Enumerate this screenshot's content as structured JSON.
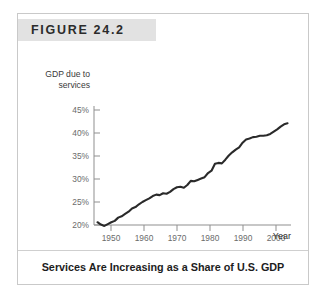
{
  "figure": {
    "label": "FIGURE 24.2",
    "caption": "Services Are Increasing as a Share of U.S. GDP"
  },
  "chart_data": {
    "type": "line",
    "title": "",
    "xlabel": "Year",
    "ylabel": "GDP due to services",
    "ylabel_line1": "GDP due to",
    "ylabel_line2": "services",
    "xlim": [
      1947,
      2004
    ],
    "ylim": [
      18,
      46
    ],
    "xticks": [
      1950,
      1960,
      1970,
      1980,
      1990,
      2000
    ],
    "xtick_labels": [
      "1950",
      "1960",
      "1970",
      "1980",
      "1990",
      "2000"
    ],
    "yticks": [
      20,
      25,
      30,
      35,
      40,
      45
    ],
    "ytick_labels": [
      "20%",
      "25%",
      "30%",
      "35%",
      "40%",
      "45%"
    ],
    "grid": false,
    "legend": null,
    "series": [
      {
        "name": "GDP due to services",
        "x": [
          1948,
          1949,
          1950,
          1951,
          1952,
          1953,
          1954,
          1955,
          1956,
          1957,
          1958,
          1959,
          1960,
          1961,
          1962,
          1963,
          1964,
          1965,
          1966,
          1967,
          1968,
          1969,
          1970,
          1971,
          1972,
          1973,
          1974,
          1975,
          1976,
          1977,
          1978,
          1979,
          1980,
          1981,
          1982,
          1983,
          1984,
          1985,
          1986,
          1987,
          1988,
          1989,
          1990,
          1991,
          1992,
          1993,
          1994,
          1995,
          1996,
          1997,
          1998,
          1999,
          2000,
          2001,
          2002,
          2003
        ],
        "values": [
          20.6,
          20.1,
          19.8,
          20.2,
          20.6,
          20.9,
          21.6,
          21.9,
          22.4,
          22.9,
          23.6,
          23.9,
          24.5,
          25.0,
          25.4,
          25.8,
          26.3,
          26.6,
          26.5,
          26.9,
          26.8,
          27.2,
          27.8,
          28.2,
          28.3,
          28.1,
          28.7,
          29.6,
          29.5,
          29.8,
          30.1,
          30.4,
          31.3,
          31.8,
          33.3,
          33.5,
          33.4,
          34.2,
          35.1,
          35.8,
          36.4,
          36.9,
          37.9,
          38.6,
          38.8,
          39.1,
          39.2,
          39.4,
          39.4,
          39.5,
          39.8,
          40.3,
          40.8,
          41.4,
          41.9,
          42.1
        ]
      }
    ]
  }
}
